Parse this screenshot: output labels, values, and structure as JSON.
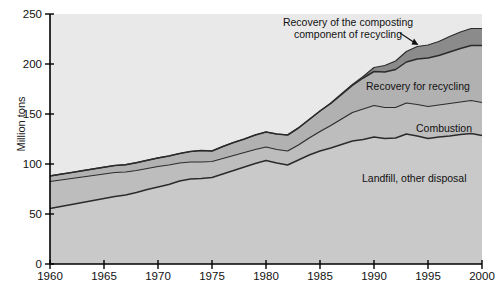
{
  "chart": {
    "ylabel": "Million tons",
    "xlabel": "",
    "title": ""
  },
  "axes": {
    "y_ticks": [
      "0",
      "50",
      "100",
      "150",
      "200",
      "250"
    ],
    "x_ticks": [
      "1960",
      "1965",
      "1970",
      "1975",
      "1980",
      "1985",
      "1990",
      "1995",
      "2000"
    ]
  },
  "annotations": {
    "composting_line1": "Recovery of the composting",
    "composting_line2": "component of recycling",
    "recycling": "Recovery for recycling",
    "combustion": "Combustion",
    "landfill": "Landfill, other disposal"
  },
  "colors": {
    "plot_background": "#e9e9e9",
    "landfill_fill": "#c9c9c9",
    "combustion_fill": "#bdbdbd",
    "recycling_fill": "#b1b1b1",
    "composting_fill": "#8b8b8b",
    "line": "#2b2b2b",
    "axis": "#000000"
  },
  "chart_data": {
    "type": "area",
    "title": "",
    "xlabel": "",
    "ylabel": "Million tons",
    "xlim": [
      1960,
      2000
    ],
    "ylim": [
      0,
      250
    ],
    "grid": false,
    "legend": "inline-annotations",
    "stacked": true,
    "x": [
      1960,
      1961,
      1962,
      1963,
      1964,
      1965,
      1966,
      1967,
      1968,
      1969,
      1970,
      1971,
      1972,
      1973,
      1974,
      1975,
      1976,
      1977,
      1978,
      1979,
      1980,
      1981,
      1982,
      1983,
      1984,
      1985,
      1986,
      1987,
      1988,
      1989,
      1990,
      1991,
      1992,
      1993,
      1994,
      1995,
      1996,
      1997,
      1998,
      1999,
      2000
    ],
    "series": [
      {
        "name": "Landfill, other disposal",
        "values": [
          55.5,
          57.5,
          59.5,
          61.5,
          63.5,
          65.5,
          67.5,
          69.0,
          71.5,
          74.5,
          77.0,
          79.5,
          83.0,
          85.0,
          85.5,
          86.5,
          90.0,
          93.5,
          97.0,
          100.5,
          103.5,
          101.0,
          99.0,
          104.0,
          109.0,
          113.0,
          116.0,
          119.5,
          123.0,
          124.5,
          127.0,
          125.5,
          126.0,
          130.0,
          128.0,
          125.5,
          127.0,
          128.0,
          129.5,
          130.5,
          128.5
        ]
      },
      {
        "name": "Combustion",
        "values": [
          27.0,
          26.5,
          26.0,
          25.5,
          25.0,
          24.5,
          24.0,
          23.0,
          22.0,
          21.0,
          20.5,
          19.5,
          18.0,
          17.0,
          16.5,
          16.0,
          15.5,
          15.0,
          14.5,
          14.0,
          13.5,
          13.5,
          14.0,
          15.0,
          17.0,
          19.5,
          22.5,
          25.5,
          28.5,
          30.5,
          31.5,
          31.0,
          30.5,
          31.0,
          31.5,
          32.0,
          32.0,
          32.5,
          32.5,
          33.0,
          33.0
        ]
      },
      {
        "name": "Recovery for recycling",
        "values": [
          5.6,
          5.8,
          6.0,
          6.3,
          6.6,
          6.8,
          7.0,
          7.3,
          7.8,
          8.2,
          8.6,
          9.0,
          9.5,
          10.5,
          11.5,
          10.5,
          12.0,
          13.0,
          13.5,
          14.5,
          15.0,
          15.5,
          16.0,
          17.0,
          18.5,
          20.5,
          22.0,
          24.5,
          27.0,
          31.0,
          34.0,
          35.5,
          38.0,
          41.0,
          45.5,
          48.5,
          49.5,
          51.5,
          53.5,
          55.0,
          57.0
        ]
      },
      {
        "name": "Recovery of the composting component of recycling",
        "values": [
          0,
          0,
          0,
          0,
          0,
          0,
          0,
          0,
          0,
          0,
          0,
          0,
          0,
          0,
          0,
          0,
          0,
          0,
          0,
          0,
          0,
          0,
          0,
          0,
          0,
          0,
          0.5,
          0.8,
          1.0,
          1.5,
          4.0,
          6.5,
          8.5,
          10.5,
          12.5,
          13.0,
          14.0,
          15.5,
          16.5,
          17.0,
          17.0
        ]
      }
    ],
    "totals": [
      88.1,
      89.8,
      91.5,
      93.3,
      95.1,
      96.8,
      98.5,
      99.3,
      101.3,
      103.7,
      106.1,
      108.0,
      110.5,
      112.5,
      113.5,
      113.0,
      117.5,
      121.5,
      125.0,
      129.0,
      132.0,
      130.0,
      129.0,
      136.0,
      144.5,
      153.0,
      161.0,
      170.3,
      179.5,
      187.5,
      196.5,
      198.5,
      203.0,
      212.5,
      217.5,
      219.0,
      222.5,
      227.5,
      232.0,
      235.5,
      235.5
    ]
  }
}
